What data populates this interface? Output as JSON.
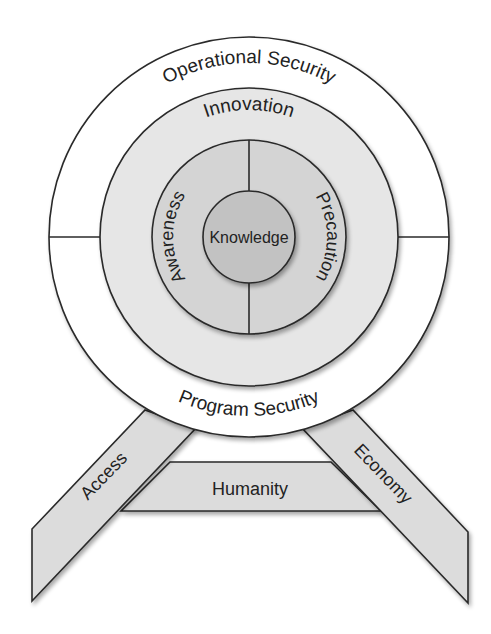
{
  "diagram": {
    "colors": {
      "background": "#ffffff",
      "outer_ring": "#ffffff",
      "middle_ring": "#e6e6e6",
      "inner_ring": "#d4d4d4",
      "core": "#c2c2c2",
      "legs": "#dcdcdc",
      "stroke": "#2a2a2a",
      "text": "#222222"
    },
    "rings": {
      "outer_top": "Operational Security",
      "outer_bottom": "Program Security",
      "middle": "Innovation",
      "inner_left": "Awareness",
      "inner_right": "Precaution",
      "core": "Knowledge"
    },
    "supports": {
      "left_leg": "Access",
      "right_leg": "Economy",
      "crossbar": "Humanity"
    }
  }
}
